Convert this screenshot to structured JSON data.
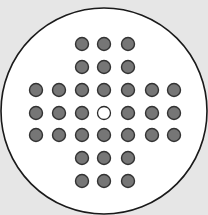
{
  "game": {
    "name": "Peg Solitaire",
    "board_type": "English cross (33 holes)",
    "background_color": "#e6e6e6",
    "board_fill": "#ffffff",
    "board_outline": "#1a1a1a",
    "peg_fill": "#767676",
    "peg_outline": "#333333",
    "empty_hole_fill": "#ffffff",
    "empty_hole_outline": "#2a2a2a",
    "board_circle": {
      "cx": 104,
      "cy": 111,
      "r": 103
    },
    "column_x": [
      36,
      59,
      82,
      104,
      128,
      152,
      174
    ],
    "row_y": [
      44,
      67,
      90,
      113,
      135,
      158,
      181
    ],
    "peg_radius": 6.5,
    "grid": [
      [
        null,
        null,
        1,
        1,
        1,
        null,
        null
      ],
      [
        null,
        null,
        1,
        1,
        1,
        null,
        null
      ],
      [
        1,
        1,
        1,
        1,
        1,
        1,
        1
      ],
      [
        1,
        1,
        1,
        0,
        1,
        1,
        1
      ],
      [
        1,
        1,
        1,
        1,
        1,
        1,
        1
      ],
      [
        null,
        null,
        1,
        1,
        1,
        null,
        null
      ],
      [
        null,
        null,
        1,
        1,
        1,
        null,
        null
      ]
    ],
    "peg_count": 32,
    "empty_hole": {
      "row": 3,
      "col": 3
    }
  }
}
